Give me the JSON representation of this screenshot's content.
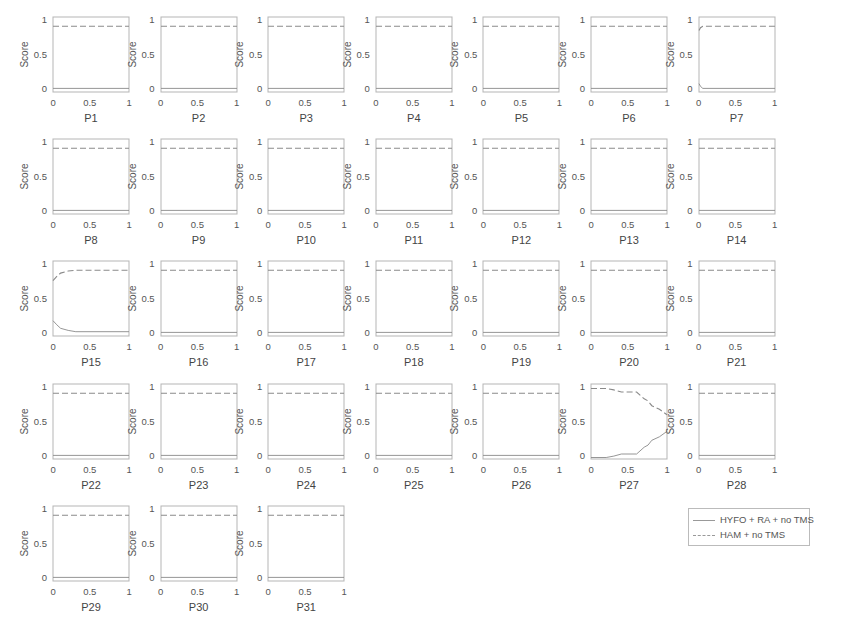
{
  "figure": {
    "top_crop_text": "",
    "legend": {
      "entries": [
        {
          "label": "HYFO + RA + no TMS",
          "style": "solid",
          "color": "#888888"
        },
        {
          "label": "HAM + no TMS",
          "style": "dashed",
          "color": "#888888"
        }
      ]
    },
    "axis_labels": {
      "y": "Score"
    },
    "ticks": {
      "x": [
        "0",
        "0.5",
        "1"
      ],
      "y": [
        "0",
        "0.5",
        "1"
      ]
    },
    "colors": {
      "line": "#8a8a8a",
      "frame": "#b5b5b5",
      "text": "#555555"
    }
  },
  "chart_data": {
    "type": "line",
    "layout": "small multiples, 7 columns x 5 rows (31 panels)",
    "xlim": [
      0,
      1
    ],
    "ylim": [
      0,
      1
    ],
    "xlabel_per_panel": "P1..P31",
    "ylabel": "Score",
    "legend_position": "bottom-right",
    "series_names": [
      "HYFO + RA + no TMS",
      "HAM + no TMS"
    ],
    "panels": [
      {
        "title": "P1",
        "x": [
          0,
          1
        ],
        "HYFO + RA + no TMS": [
          0.03,
          0.03
        ],
        "HAM + no TMS": [
          0.93,
          0.93
        ]
      },
      {
        "title": "P2",
        "x": [
          0,
          1
        ],
        "HYFO + RA + no TMS": [
          0.03,
          0.03
        ],
        "HAM + no TMS": [
          0.93,
          0.93
        ]
      },
      {
        "title": "P3",
        "x": [
          0,
          1
        ],
        "HYFO + RA + no TMS": [
          0.03,
          0.03
        ],
        "HAM + no TMS": [
          0.93,
          0.93
        ]
      },
      {
        "title": "P4",
        "x": [
          0,
          1
        ],
        "HYFO + RA + no TMS": [
          0.03,
          0.03
        ],
        "HAM + no TMS": [
          0.93,
          0.93
        ]
      },
      {
        "title": "P5",
        "x": [
          0,
          1
        ],
        "HYFO + RA + no TMS": [
          0.03,
          0.03
        ],
        "HAM + no TMS": [
          0.93,
          0.93
        ]
      },
      {
        "title": "P6",
        "x": [
          0,
          1
        ],
        "HYFO + RA + no TMS": [
          0.03,
          0.03
        ],
        "HAM + no TMS": [
          0.93,
          0.93
        ]
      },
      {
        "title": "P7",
        "x": [
          0,
          0.02,
          0.05,
          1
        ],
        "HYFO + RA + no TMS": [
          0.1,
          0.06,
          0.03,
          0.03
        ],
        "HAM + no TMS": [
          0.87,
          0.91,
          0.93,
          0.93
        ]
      },
      {
        "title": "P8",
        "x": [
          0,
          1
        ],
        "HYFO + RA + no TMS": [
          0.03,
          0.03
        ],
        "HAM + no TMS": [
          0.93,
          0.93
        ]
      },
      {
        "title": "P9",
        "x": [
          0,
          1
        ],
        "HYFO + RA + no TMS": [
          0.03,
          0.03
        ],
        "HAM + no TMS": [
          0.93,
          0.93
        ]
      },
      {
        "title": "P10",
        "x": [
          0,
          1
        ],
        "HYFO + RA + no TMS": [
          0.03,
          0.03
        ],
        "HAM + no TMS": [
          0.93,
          0.93
        ]
      },
      {
        "title": "P11",
        "x": [
          0,
          1
        ],
        "HYFO + RA + no TMS": [
          0.03,
          0.03
        ],
        "HAM + no TMS": [
          0.93,
          0.93
        ]
      },
      {
        "title": "P12",
        "x": [
          0,
          1
        ],
        "HYFO + RA + no TMS": [
          0.03,
          0.03
        ],
        "HAM + no TMS": [
          0.93,
          0.93
        ]
      },
      {
        "title": "P13",
        "x": [
          0,
          1
        ],
        "HYFO + RA + no TMS": [
          0.03,
          0.03
        ],
        "HAM + no TMS": [
          0.93,
          0.93
        ]
      },
      {
        "title": "P14",
        "x": [
          0,
          1
        ],
        "HYFO + RA + no TMS": [
          0.03,
          0.03
        ],
        "HAM + no TMS": [
          0.93,
          0.93
        ]
      },
      {
        "title": "P15",
        "x": [
          0,
          0.05,
          0.1,
          0.2,
          0.3,
          1
        ],
        "HYFO + RA + no TMS": [
          0.2,
          0.14,
          0.09,
          0.06,
          0.04,
          0.04
        ],
        "HAM + no TMS": [
          0.78,
          0.84,
          0.89,
          0.92,
          0.93,
          0.93
        ]
      },
      {
        "title": "P16",
        "x": [
          0,
          1
        ],
        "HYFO + RA + no TMS": [
          0.03,
          0.03
        ],
        "HAM + no TMS": [
          0.93,
          0.93
        ]
      },
      {
        "title": "P17",
        "x": [
          0,
          1
        ],
        "HYFO + RA + no TMS": [
          0.03,
          0.03
        ],
        "HAM + no TMS": [
          0.93,
          0.93
        ]
      },
      {
        "title": "P18",
        "x": [
          0,
          1
        ],
        "HYFO + RA + no TMS": [
          0.03,
          0.03
        ],
        "HAM + no TMS": [
          0.93,
          0.93
        ]
      },
      {
        "title": "P19",
        "x": [
          0,
          1
        ],
        "HYFO + RA + no TMS": [
          0.03,
          0.03
        ],
        "HAM + no TMS": [
          0.93,
          0.93
        ]
      },
      {
        "title": "P20",
        "x": [
          0,
          1
        ],
        "HYFO + RA + no TMS": [
          0.03,
          0.03
        ],
        "HAM + no TMS": [
          0.93,
          0.93
        ]
      },
      {
        "title": "P21",
        "x": [
          0,
          1
        ],
        "HYFO + RA + no TMS": [
          0.03,
          0.03
        ],
        "HAM + no TMS": [
          0.93,
          0.93
        ]
      },
      {
        "title": "P22",
        "x": [
          0,
          1
        ],
        "HYFO + RA + no TMS": [
          0.03,
          0.03
        ],
        "HAM + no TMS": [
          0.93,
          0.93
        ]
      },
      {
        "title": "P23",
        "x": [
          0,
          1
        ],
        "HYFO + RA + no TMS": [
          0.03,
          0.03
        ],
        "HAM + no TMS": [
          0.93,
          0.93
        ]
      },
      {
        "title": "P24",
        "x": [
          0,
          1
        ],
        "HYFO + RA + no TMS": [
          0.03,
          0.03
        ],
        "HAM + no TMS": [
          0.93,
          0.93
        ]
      },
      {
        "title": "P25",
        "x": [
          0,
          1
        ],
        "HYFO + RA + no TMS": [
          0.03,
          0.03
        ],
        "HAM + no TMS": [
          0.93,
          0.93
        ]
      },
      {
        "title": "P26",
        "x": [
          0,
          1
        ],
        "HYFO + RA + no TMS": [
          0.03,
          0.03
        ],
        "HAM + no TMS": [
          0.93,
          0.93
        ]
      },
      {
        "title": "P27",
        "x": [
          0,
          0.2,
          0.3,
          0.4,
          0.6,
          0.7,
          0.75,
          0.8,
          0.9,
          1
        ],
        "HYFO + RA + no TMS": [
          0,
          0,
          0.02,
          0.05,
          0.05,
          0.15,
          0.18,
          0.25,
          0.3,
          0.38
        ],
        "HAM + no TMS": [
          1,
          1,
          0.98,
          0.95,
          0.95,
          0.85,
          0.82,
          0.75,
          0.7,
          0.62
        ]
      },
      {
        "title": "P28",
        "x": [
          0,
          1
        ],
        "HYFO + RA + no TMS": [
          0.03,
          0.03
        ],
        "HAM + no TMS": [
          0.93,
          0.93
        ]
      },
      {
        "title": "P29",
        "x": [
          0,
          1
        ],
        "HYFO + RA + no TMS": [
          0.03,
          0.03
        ],
        "HAM + no TMS": [
          0.93,
          0.93
        ]
      },
      {
        "title": "P30",
        "x": [
          0,
          1
        ],
        "HYFO + RA + no TMS": [
          0.03,
          0.03
        ],
        "HAM + no TMS": [
          0.93,
          0.93
        ]
      },
      {
        "title": "P31",
        "x": [
          0,
          1
        ],
        "HYFO + RA + no TMS": [
          0.03,
          0.03
        ],
        "HAM + no TMS": [
          0.93,
          0.93
        ]
      }
    ]
  }
}
